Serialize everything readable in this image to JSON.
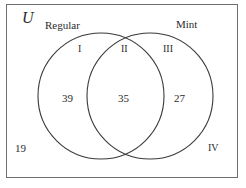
{
  "diagram": {
    "type": "venn-2-set",
    "universe_label": "U",
    "sets": [
      {
        "name": "Regular",
        "only_count": "39"
      },
      {
        "name": "Mint",
        "only_count": "27"
      }
    ],
    "intersection_count": "35",
    "outside_count": "19",
    "regions": [
      {
        "numeral": "I",
        "meaning": "Regular only",
        "value": "39"
      },
      {
        "numeral": "II",
        "meaning": "Regular and Mint",
        "value": "35"
      },
      {
        "numeral": "III",
        "meaning": "Mint only",
        "value": "27"
      },
      {
        "numeral": "IV",
        "meaning": "Neither",
        "value": "19"
      }
    ],
    "colors": {
      "stroke": "#3a3a3a",
      "border": "#6f6f6f",
      "text": "#2b2b2b",
      "background": "#ffffff"
    }
  }
}
